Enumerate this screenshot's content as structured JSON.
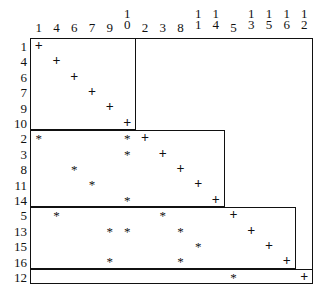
{
  "figure": {
    "type": "block-diagonal-permuted-incidence-matrix",
    "title": "",
    "marker_legend": {
      "plus": "+",
      "star": "*"
    }
  },
  "axes": {
    "column_labels": [
      "1",
      "4",
      "6",
      "7",
      "9",
      "10",
      "2",
      "3",
      "8",
      "11",
      "14",
      "5",
      "13",
      "15",
      "16",
      "12"
    ],
    "row_labels": [
      "1",
      "4",
      "6",
      "7",
      "9",
      "10",
      "2",
      "3",
      "8",
      "11",
      "14",
      "5",
      "13",
      "15",
      "16",
      "12"
    ]
  },
  "blocks": [
    {
      "name": "block-1",
      "row_start": 0,
      "row_end": 5,
      "col_start": 0,
      "col_end": 5
    },
    {
      "name": "block-2",
      "row_start": 6,
      "row_end": 10,
      "col_start": 0,
      "col_end": 10
    },
    {
      "name": "block-3",
      "row_start": 11,
      "row_end": 14,
      "col_start": 0,
      "col_end": 14
    },
    {
      "name": "block-4",
      "row_start": 15,
      "row_end": 15,
      "col_start": 0,
      "col_end": 15
    }
  ],
  "cells": [
    {
      "row": 0,
      "col": 0,
      "mark": "+"
    },
    {
      "row": 1,
      "col": 1,
      "mark": "+"
    },
    {
      "row": 2,
      "col": 2,
      "mark": "+"
    },
    {
      "row": 3,
      "col": 3,
      "mark": "+"
    },
    {
      "row": 4,
      "col": 4,
      "mark": "+"
    },
    {
      "row": 5,
      "col": 5,
      "mark": "+"
    },
    {
      "row": 6,
      "col": 0,
      "mark": "*"
    },
    {
      "row": 6,
      "col": 5,
      "mark": "*"
    },
    {
      "row": 6,
      "col": 6,
      "mark": "+"
    },
    {
      "row": 7,
      "col": 5,
      "mark": "*"
    },
    {
      "row": 7,
      "col": 7,
      "mark": "+"
    },
    {
      "row": 8,
      "col": 2,
      "mark": "*"
    },
    {
      "row": 8,
      "col": 8,
      "mark": "+"
    },
    {
      "row": 9,
      "col": 3,
      "mark": "*"
    },
    {
      "row": 9,
      "col": 9,
      "mark": "+"
    },
    {
      "row": 10,
      "col": 5,
      "mark": "*"
    },
    {
      "row": 10,
      "col": 10,
      "mark": "+"
    },
    {
      "row": 11,
      "col": 1,
      "mark": "*"
    },
    {
      "row": 11,
      "col": 7,
      "mark": "*"
    },
    {
      "row": 11,
      "col": 11,
      "mark": "+"
    },
    {
      "row": 12,
      "col": 4,
      "mark": "*"
    },
    {
      "row": 12,
      "col": 5,
      "mark": "*"
    },
    {
      "row": 12,
      "col": 8,
      "mark": "*"
    },
    {
      "row": 12,
      "col": 12,
      "mark": "+"
    },
    {
      "row": 13,
      "col": 9,
      "mark": "*"
    },
    {
      "row": 13,
      "col": 13,
      "mark": "+"
    },
    {
      "row": 14,
      "col": 4,
      "mark": "*"
    },
    {
      "row": 14,
      "col": 8,
      "mark": "*"
    },
    {
      "row": 14,
      "col": 14,
      "mark": "+"
    },
    {
      "row": 15,
      "col": 11,
      "mark": "*"
    },
    {
      "row": 15,
      "col": 15,
      "mark": "+"
    }
  ],
  "geometry": {
    "left": 30,
    "top": 38,
    "col_width": 17.7,
    "row_height": 15.4,
    "n_cols": 16,
    "n_rows": 16
  },
  "colors": {
    "ink": "#111111",
    "background": "#ffffff"
  }
}
